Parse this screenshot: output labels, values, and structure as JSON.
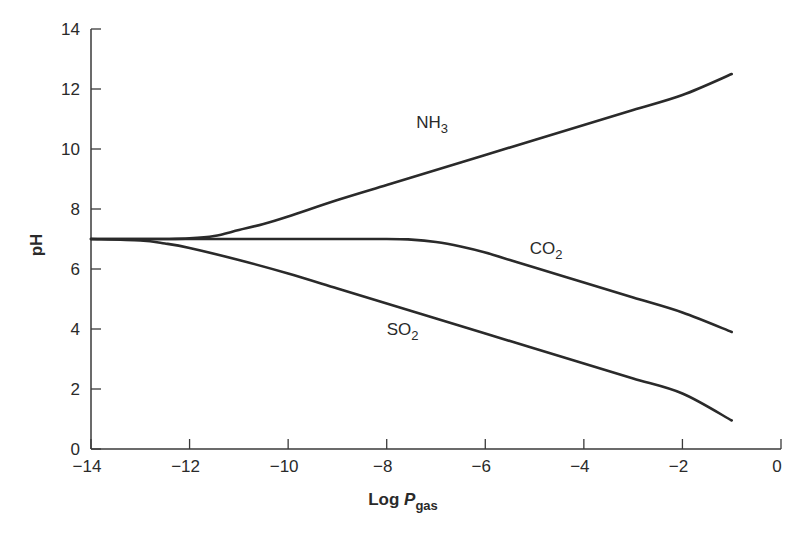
{
  "chart_data": {
    "type": "line",
    "title": "",
    "xlabel": "Log P_gas",
    "xlabel_parts": {
      "main": "Log ",
      "italic": "P",
      "subscript": "gas"
    },
    "ylabel": "pH",
    "xlim": [
      -14,
      0
    ],
    "ylim": [
      0,
      14
    ],
    "xticks": [
      -14,
      -12,
      -10,
      -8,
      -6,
      -4,
      -2,
      0
    ],
    "xtick_labels": [
      "−14",
      "−12",
      "−10",
      "−8",
      "−6",
      "−4",
      "−2",
      "0"
    ],
    "yticks": [
      0,
      2,
      4,
      6,
      8,
      10,
      12,
      14
    ],
    "ytick_labels": [
      "0",
      "2",
      "4",
      "6",
      "8",
      "10",
      "12",
      "14"
    ],
    "grid": false,
    "legend": "inline labels",
    "series": [
      {
        "name": "NH3",
        "label_main": "NH",
        "label_sub": "3",
        "label_pos": [
          -7.4,
          10.7
        ],
        "x": [
          -14,
          -13,
          -12.5,
          -12,
          -11.5,
          -11,
          -10.5,
          -10,
          -9,
          -8,
          -7,
          -6,
          -5,
          -4,
          -3,
          -2,
          -1
        ],
        "y": [
          7.0,
          7.0,
          7.0,
          7.02,
          7.1,
          7.3,
          7.5,
          7.75,
          8.3,
          8.8,
          9.3,
          9.8,
          10.3,
          10.8,
          11.3,
          11.8,
          12.5
        ]
      },
      {
        "name": "CO2",
        "label_main": "CO",
        "label_sub": "2",
        "label_pos": [
          -5.1,
          6.5
        ],
        "x": [
          -14,
          -12,
          -10,
          -8,
          -7.5,
          -7,
          -6.5,
          -6,
          -5.5,
          -5,
          -4,
          -3,
          -2,
          -1
        ],
        "y": [
          7.0,
          7.0,
          7.0,
          7.0,
          6.98,
          6.9,
          6.75,
          6.55,
          6.3,
          6.05,
          5.55,
          5.05,
          4.55,
          3.9
        ]
      },
      {
        "name": "SO2",
        "label_main": "SO",
        "label_sub": "2",
        "label_pos": [
          -8.0,
          3.8
        ],
        "x": [
          -14,
          -13,
          -12.5,
          -12,
          -11,
          -10,
          -9,
          -8,
          -7,
          -6,
          -5,
          -4,
          -3,
          -2,
          -1
        ],
        "y": [
          7.0,
          6.95,
          6.85,
          6.7,
          6.3,
          5.85,
          5.35,
          4.85,
          4.35,
          3.85,
          3.35,
          2.85,
          2.35,
          1.85,
          0.95
        ]
      }
    ]
  },
  "colors": {
    "line": "#2a2a2a",
    "axis": "#3a3a3a",
    "background": "#ffffff"
  }
}
